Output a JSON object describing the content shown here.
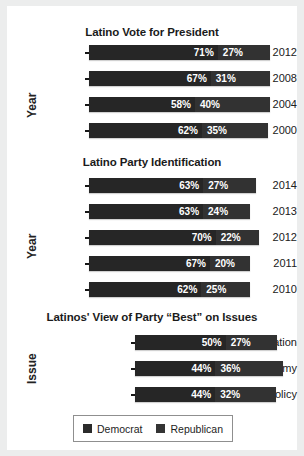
{
  "legend": {
    "items": [
      {
        "name": "Democrat",
        "color": "#2b2b2b"
      },
      {
        "name": "Republican",
        "color": "#343434"
      }
    ]
  },
  "chart_data": [
    {
      "type": "bar",
      "orientation": "horizontal",
      "stacked": true,
      "title": "Latino Vote for President",
      "ylabel": "Year",
      "xlabel": "",
      "categories": [
        "2012",
        "2008",
        "2004",
        "2000"
      ],
      "series": [
        {
          "name": "Democrat",
          "values": [
            71,
            67,
            58,
            62
          ],
          "labels": [
            "71%",
            "67%",
            "58%",
            "62%"
          ]
        },
        {
          "name": "Republican",
          "values": [
            27,
            31,
            40,
            35
          ],
          "labels": [
            "27%",
            "31%",
            "40%",
            "35%"
          ]
        }
      ]
    },
    {
      "type": "bar",
      "orientation": "horizontal",
      "stacked": true,
      "title": "Latino Party Identification",
      "ylabel": "Year",
      "xlabel": "",
      "categories": [
        "2014",
        "2013",
        "2012",
        "2011",
        "2010"
      ],
      "series": [
        {
          "name": "Democrat",
          "values": [
            63,
            63,
            70,
            67,
            62
          ],
          "labels": [
            "63%",
            "63%",
            "70%",
            "67%",
            "62%"
          ]
        },
        {
          "name": "Republican",
          "values": [
            27,
            24,
            22,
            20,
            25
          ],
          "labels": [
            "27%",
            "24%",
            "22%",
            "20%",
            "25%"
          ]
        }
      ]
    },
    {
      "type": "bar",
      "orientation": "horizontal",
      "stacked": true,
      "title": "Latinos' View of Party “Best” on Issues",
      "ylabel": "Issue",
      "xlabel": "",
      "categories": [
        "Immigration",
        "Economy",
        "Foreign Policy"
      ],
      "series": [
        {
          "name": "Democrat",
          "values": [
            50,
            44,
            44
          ],
          "labels": [
            "50%",
            "44%",
            "44%"
          ]
        },
        {
          "name": "Republican",
          "values": [
            27,
            36,
            32
          ],
          "labels": [
            "27%",
            "36%",
            "32%"
          ]
        }
      ]
    }
  ]
}
